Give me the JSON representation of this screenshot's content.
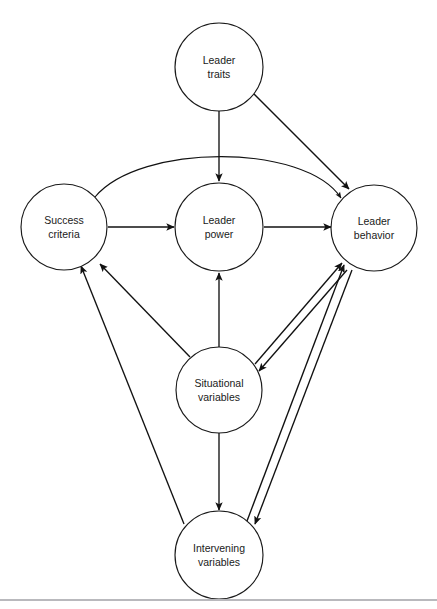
{
  "figure": {
    "type": "diagram",
    "subtype": "node-link-causal-model",
    "background_color": "#ffffff",
    "stroke_color": "#111111",
    "label_color": "#1a1a1a",
    "width": 437,
    "height": 609
  },
  "nodes": [
    {
      "id": "leader-traits",
      "line1": "Leader",
      "line2": "traits",
      "cx": 219,
      "cy": 67,
      "r": 44
    },
    {
      "id": "success-criteria",
      "line1": "Success",
      "line2": "criteria",
      "cx": 64,
      "cy": 227,
      "r": 43
    },
    {
      "id": "leader-power",
      "line1": "Leader",
      "line2": "power",
      "cx": 219,
      "cy": 227,
      "r": 44
    },
    {
      "id": "leader-behavior",
      "line1": "Leader",
      "line2": "behavior",
      "cx": 374,
      "cy": 228,
      "r": 43
    },
    {
      "id": "situational-variables",
      "line1": "Situational",
      "line2": "variables",
      "cx": 219,
      "cy": 390,
      "r": 43
    },
    {
      "id": "intervening-variables",
      "line1": "Intervening",
      "line2": "variables",
      "cx": 219,
      "cy": 555,
      "r": 44
    }
  ],
  "edges": [
    {
      "id": "traits-to-power",
      "from": "leader-traits",
      "to": "leader-power",
      "shape": "straight",
      "direction": "one-way"
    },
    {
      "id": "traits-to-behavior",
      "from": "leader-traits",
      "to": "leader-behavior",
      "shape": "straight",
      "direction": "one-way"
    },
    {
      "id": "success-to-power",
      "from": "success-criteria",
      "to": "leader-power",
      "shape": "straight",
      "direction": "one-way"
    },
    {
      "id": "power-to-behavior",
      "from": "leader-power",
      "to": "leader-behavior",
      "shape": "straight",
      "direction": "one-way"
    },
    {
      "id": "success-to-behavior",
      "from": "success-criteria",
      "to": "leader-behavior",
      "shape": "arc",
      "direction": "one-way"
    },
    {
      "id": "situational-to-power",
      "from": "situational-variables",
      "to": "leader-power",
      "shape": "straight",
      "direction": "one-way"
    },
    {
      "id": "situational-to-success",
      "from": "situational-variables",
      "to": "success-criteria",
      "shape": "straight",
      "direction": "one-way"
    },
    {
      "id": "situational-to-intervening",
      "from": "situational-variables",
      "to": "intervening-variables",
      "shape": "straight",
      "direction": "one-way"
    },
    {
      "id": "situational-behavior-pair",
      "from": "situational-variables",
      "to": "leader-behavior",
      "shape": "double",
      "direction": "two-way"
    },
    {
      "id": "intervening-to-success",
      "from": "intervening-variables",
      "to": "success-criteria",
      "shape": "straight",
      "direction": "one-way"
    },
    {
      "id": "intervening-behavior-pair",
      "from": "intervening-variables",
      "to": "leader-behavior",
      "shape": "double",
      "direction": "two-way"
    }
  ],
  "labels": {
    "leader_traits_l1": "Leader",
    "leader_traits_l2": "traits",
    "success_criteria_l1": "Success",
    "success_criteria_l2": "criteria",
    "leader_power_l1": "Leader",
    "leader_power_l2": "power",
    "leader_behavior_l1": "Leader",
    "leader_behavior_l2": "behavior",
    "situational_l1": "Situational",
    "situational_l2": "variables",
    "intervening_l1": "Intervening",
    "intervening_l2": "variables"
  },
  "footer": {
    "rule_color": "#b9b9bd"
  }
}
